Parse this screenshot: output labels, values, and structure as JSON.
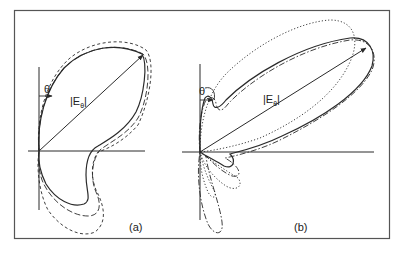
{
  "figure": {
    "type": "polar radiation pattern diagram",
    "panels": [
      {
        "id": "a",
        "caption": "(a)",
        "angle_label": "θ",
        "magnitude_label_prefix": "|E",
        "magnitude_label_sub": "θ",
        "magnitude_label_suffix": "|",
        "curves": [
          "solid",
          "long-dash",
          "short-dash"
        ]
      },
      {
        "id": "b",
        "caption": "(b)",
        "angle_label": "θ",
        "magnitude_label_prefix": "|E",
        "magnitude_label_sub": "θ",
        "magnitude_label_suffix": "|",
        "curves": [
          "solid",
          "dash-dot",
          "dotted"
        ]
      }
    ],
    "colors": {
      "line": "#2a2a2a",
      "frame": "#555555",
      "background": "#ffffff"
    }
  }
}
